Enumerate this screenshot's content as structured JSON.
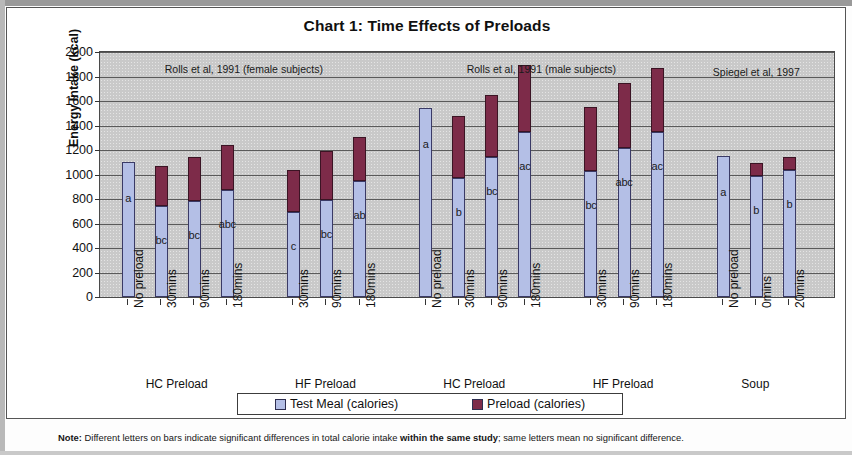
{
  "chart_data": {
    "type": "bar",
    "subtype": "stacked",
    "title": "Chart 1:  Time Effects of Preloads",
    "xlabel": "",
    "ylabel": "Energy Intake (kcal)",
    "ylim": [
      0,
      2000
    ],
    "ytick_step": 200,
    "yticks": [
      "2000",
      "1800",
      "1600",
      "1400",
      "1200",
      "1000",
      "800",
      "600",
      "400",
      "200",
      "0"
    ],
    "grid": true,
    "legend_position": "bottom",
    "series": [
      {
        "name": "Test Meal (calories)",
        "color": "#b4bfe6"
      },
      {
        "name": "Preload (calories)",
        "color": "#7d2b49"
      }
    ],
    "annotations": [
      {
        "text": "Rolls et al, 1991 (female subjects)",
        "x_center_pct": 26.5
      },
      {
        "text": "Rolls et al, 1991 (male subjects)",
        "x_center_pct": 69.5
      },
      {
        "text": "Spiegel et al, 1997",
        "x_center_pct": 93.5
      }
    ],
    "groups": [
      {
        "study": "Rolls et al, 1991 (female subjects)",
        "group_label": "HC Preload",
        "categories": [
          "No preload",
          "30mins",
          "90mins",
          "180mins"
        ],
        "test_meal": [
          1100,
          740,
          780,
          870
        ],
        "preload": [
          0,
          330,
          365,
          370
        ],
        "totals": [
          1100,
          1070,
          1145,
          1240
        ],
        "sig_letters": [
          "a",
          "bc",
          "bc",
          "abc"
        ]
      },
      {
        "study": "Rolls et al, 1991 (female subjects)",
        "group_label": "HF Preload",
        "categories": [
          "30mins",
          "90mins",
          "180mins"
        ],
        "test_meal": [
          690,
          790,
          945
        ],
        "preload": [
          350,
          400,
          360
        ],
        "totals": [
          1040,
          1190,
          1305
        ],
        "sig_letters": [
          "c",
          "bc",
          "ab"
        ]
      },
      {
        "study": "Rolls et al, 1991 (male subjects)",
        "group_label": "HC Preload",
        "categories": [
          "No preload",
          "30mins",
          "90mins",
          "180mins"
        ],
        "test_meal": [
          1540,
          970,
          1140,
          1350
        ],
        "preload": [
          0,
          510,
          510,
          540
        ],
        "totals": [
          1540,
          1480,
          1650,
          1890
        ],
        "sig_letters": [
          "a",
          "b",
          "bc",
          "ac"
        ]
      },
      {
        "study": "Rolls et al, 1991 (male subjects)",
        "group_label": "HF Preload",
        "categories": [
          "30mins",
          "90mins",
          "180mins"
        ],
        "test_meal": [
          1030,
          1220,
          1350
        ],
        "preload": [
          520,
          530,
          520
        ],
        "totals": [
          1550,
          1750,
          1870
        ],
        "sig_letters": [
          "bc",
          "abc",
          "ac"
        ]
      },
      {
        "study": "Spiegel et al, 1997",
        "group_label": "Soup",
        "categories": [
          "No preload",
          "0mins",
          "20mins"
        ],
        "test_meal": [
          1150,
          990,
          1040
        ],
        "preload": [
          0,
          100,
          105
        ],
        "totals": [
          1150,
          1090,
          1145
        ],
        "sig_letters": [
          "a",
          "b",
          "b"
        ]
      }
    ]
  },
  "legend": {
    "items": [
      {
        "label": "Test Meal (calories)",
        "color": "#b4bfe6"
      },
      {
        "label": "Preload (calories)",
        "color": "#7d2b49"
      }
    ]
  },
  "footnote": {
    "prefix": "Note:",
    "part1": " Different letters on bars indicate significant differences in total calorie intake ",
    "emphasis": "within the same study",
    "part2": "; same letters mean no significant difference."
  },
  "colors": {
    "test_meal": "#b4bfe6",
    "preload": "#7d2b49",
    "plot_background": "#c9c9c9",
    "axis": "#4a4a4a"
  }
}
